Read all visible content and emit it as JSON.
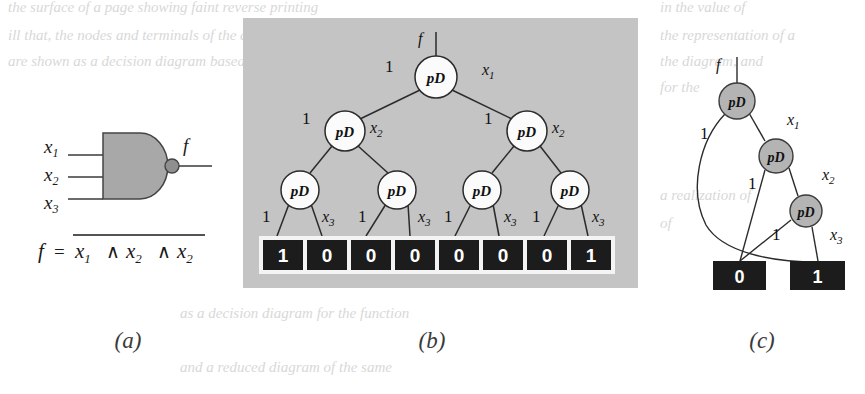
{
  "figure": {
    "captions": [
      {
        "id": "a",
        "text": "(a)",
        "x": 128,
        "y": 348
      },
      {
        "id": "b",
        "text": "(b)",
        "x": 432,
        "y": 348
      },
      {
        "id": "c",
        "text": "(c)",
        "x": 762,
        "y": 348
      }
    ],
    "background_bleed_text": [
      {
        "text": "the surface of a page showing faint reverse printing",
        "x": 8,
        "y": 12
      },
      {
        "text": "ill that, the nodes and terminals of the diagram",
        "x": 8,
        "y": 40
      },
      {
        "text": "are shown as a decision diagram based on",
        "x": 8,
        "y": 66
      },
      {
        "text": "in the value of",
        "x": 660,
        "y": 12
      },
      {
        "text": "the representation of a",
        "x": 660,
        "y": 40
      },
      {
        "text": "the diagram, and",
        "x": 660,
        "y": 66
      },
      {
        "text": "for the",
        "x": 660,
        "y": 92
      },
      {
        "text": "a realization of",
        "x": 660,
        "y": 200
      },
      {
        "text": "of",
        "x": 660,
        "y": 228
      },
      {
        "text": "as a decision diagram for the function",
        "x": 180,
        "y": 318
      },
      {
        "text": "and a reduced diagram of the same",
        "x": 180,
        "y": 372
      }
    ]
  },
  "panel_a": {
    "name": "nand-gate-diagram",
    "gate_type": "NAND",
    "inputs": [
      {
        "label": "x",
        "sub": "1",
        "label_x": 50,
        "label_y": 150,
        "wire_y": 155
      },
      {
        "label": "x",
        "sub": "2",
        "label_x": 50,
        "label_y": 178,
        "wire_y": 177
      },
      {
        "label": "x",
        "sub": "3",
        "label_x": 50,
        "label_y": 206,
        "wire_y": 199
      }
    ],
    "output": {
      "label": "f",
      "x": 185,
      "y": 150
    },
    "gate_fill": "#a8a8a8",
    "formula": {
      "lhs": "f",
      "eq": "=",
      "terms": [
        {
          "base": "x",
          "sub": "1"
        },
        {
          "base": "x",
          "sub": "2"
        },
        {
          "base": "x",
          "sub": "2"
        }
      ],
      "operator": "∧",
      "overbar": true
    }
  },
  "panel_b": {
    "name": "full-decision-diagram",
    "panel_fill": "#c4c4c4",
    "panel": {
      "x": 243,
      "y": 18,
      "w": 395,
      "h": 270
    },
    "root_label": "f",
    "node_label": "pD",
    "nodes": [
      {
        "id": "n0",
        "cx": 436,
        "cy": 77,
        "r": 21,
        "level": 0
      },
      {
        "id": "n1",
        "cx": 345,
        "cy": 131,
        "r": 20,
        "level": 1
      },
      {
        "id": "n2",
        "cx": 527,
        "cy": 131,
        "r": 20,
        "level": 1
      },
      {
        "id": "n3",
        "cx": 300,
        "cy": 190,
        "r": 19,
        "level": 2
      },
      {
        "id": "n4",
        "cx": 397,
        "cy": 190,
        "r": 19,
        "level": 2
      },
      {
        "id": "n5",
        "cx": 482,
        "cy": 190,
        "r": 19,
        "level": 2
      },
      {
        "id": "n6",
        "cx": 570,
        "cy": 190,
        "r": 19,
        "level": 2
      }
    ],
    "edge_labels": [
      {
        "text": "1",
        "x": 385,
        "y": 72,
        "kind": "const"
      },
      {
        "text": "x",
        "sub": "1",
        "x": 482,
        "y": 75,
        "kind": "var"
      },
      {
        "text": "1",
        "x": 302,
        "y": 124,
        "kind": "const"
      },
      {
        "text": "x",
        "sub": "2",
        "x": 370,
        "y": 133,
        "kind": "var"
      },
      {
        "text": "1",
        "x": 484,
        "y": 124,
        "kind": "const"
      },
      {
        "text": "x",
        "sub": "2",
        "x": 552,
        "y": 133,
        "kind": "var"
      },
      {
        "text": "1",
        "x": 262,
        "y": 222,
        "kind": "const"
      },
      {
        "text": "x",
        "sub": "3",
        "x": 322,
        "y": 222,
        "kind": "var"
      },
      {
        "text": "1",
        "x": 358,
        "y": 222,
        "kind": "const"
      },
      {
        "text": "x",
        "sub": "3",
        "x": 418,
        "y": 222,
        "kind": "var"
      },
      {
        "text": "1",
        "x": 444,
        "y": 222,
        "kind": "const"
      },
      {
        "text": "x",
        "sub": "3",
        "x": 504,
        "y": 222,
        "kind": "var"
      },
      {
        "text": "1",
        "x": 532,
        "y": 222,
        "kind": "const"
      },
      {
        "text": "x",
        "sub": "3",
        "x": 592,
        "y": 222,
        "kind": "var"
      }
    ],
    "terminal_strip": {
      "x": 259,
      "y": 236,
      "w": 356,
      "h": 38
    },
    "terminals": [
      "1",
      "0",
      "0",
      "0",
      "0",
      "0",
      "0",
      "1"
    ]
  },
  "panel_c": {
    "name": "reduced-decision-diagram",
    "root_label": "f",
    "node_label": "pD",
    "nodes": [
      {
        "id": "m0",
        "cx": 737,
        "cy": 101,
        "r": 18
      },
      {
        "id": "m1",
        "cx": 776,
        "cy": 156,
        "r": 17
      },
      {
        "id": "m2",
        "cx": 806,
        "cy": 211,
        "r": 16
      }
    ],
    "edge_labels": [
      {
        "text": "1",
        "x": 700,
        "y": 139,
        "kind": "const"
      },
      {
        "text": "x",
        "sub": "1",
        "x": 787,
        "y": 125,
        "kind": "var"
      },
      {
        "text": "1",
        "x": 748,
        "y": 189,
        "kind": "const"
      },
      {
        "text": "x",
        "sub": "2",
        "x": 822,
        "y": 180,
        "kind": "var"
      },
      {
        "text": "1",
        "x": 772,
        "y": 240,
        "kind": "const"
      },
      {
        "text": "x",
        "sub": "3",
        "x": 830,
        "y": 240,
        "kind": "var"
      }
    ],
    "terminals": [
      {
        "value": "0",
        "x": 713,
        "y": 261,
        "w": 53,
        "h": 29
      },
      {
        "value": "1",
        "x": 790,
        "y": 261,
        "w": 55,
        "h": 29
      }
    ]
  }
}
